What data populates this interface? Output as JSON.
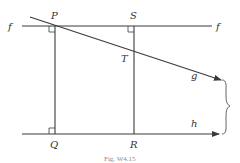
{
  "figure": {
    "caption": "Fig. W4.15",
    "lines": {
      "f_left": "f",
      "f_right": "f",
      "g": "g",
      "h": "h"
    },
    "points": {
      "P": "P",
      "S": "S",
      "T": "T",
      "Q": "Q",
      "R": "R"
    },
    "colors": {
      "stroke": "#3a3a3a",
      "text": "#333333"
    }
  }
}
